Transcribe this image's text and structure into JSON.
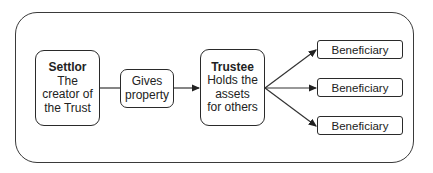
{
  "diagram": {
    "type": "flowchart",
    "nodes": {
      "settlor": {
        "title": "Settlor",
        "lines": [
          "The",
          "creator of",
          "the Trust"
        ]
      },
      "gives": {
        "lines": [
          "Gives",
          "property"
        ]
      },
      "trustee": {
        "title": "Trustee",
        "lines": [
          "Holds the",
          "assets",
          "for others"
        ]
      },
      "beneficiaries": [
        {
          "label": "Beneficiary"
        },
        {
          "label": "Beneficiary"
        },
        {
          "label": "Beneficiary"
        }
      ]
    },
    "edges": [
      {
        "from": "settlor",
        "to": "gives",
        "arrow": false
      },
      {
        "from": "gives",
        "to": "trustee",
        "arrow": true
      },
      {
        "from": "trustee",
        "to": "beneficiary-1",
        "arrow": true
      },
      {
        "from": "trustee",
        "to": "beneficiary-2",
        "arrow": true
      },
      {
        "from": "trustee",
        "to": "beneficiary-3",
        "arrow": true
      }
    ]
  }
}
